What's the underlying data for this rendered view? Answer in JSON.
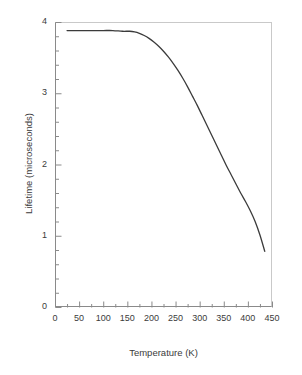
{
  "chart_data": {
    "type": "line",
    "title": "",
    "xlabel": "Temperature (K)",
    "ylabel": "Lifetime (microseconds)",
    "xlim": [
      0,
      450
    ],
    "ylim": [
      0,
      4
    ],
    "xticks": [
      0,
      50,
      100,
      150,
      200,
      250,
      300,
      350,
      400,
      450
    ],
    "yticks": [
      0,
      1,
      2,
      3,
      4
    ],
    "xtick_labels": [
      "0",
      "50",
      "100",
      "150",
      "200",
      "250",
      "300",
      "350",
      "400",
      "450"
    ],
    "ytick_labels": [
      "0",
      "1",
      "2",
      "3",
      "4"
    ],
    "x_minor_interval": 25,
    "y_minor_interval": 0.2,
    "grid": false,
    "legend": false,
    "line_color": "#3b3b3b",
    "line_width": 1.3,
    "series": [
      {
        "name": "Lifetime",
        "x": [
          25,
          40,
          60,
          80,
          100,
          120,
          140,
          155,
          165,
          175,
          185,
          195,
          205,
          215,
          225,
          235,
          245,
          255,
          265,
          275,
          285,
          295,
          305,
          315,
          325,
          335,
          345,
          355,
          365,
          375,
          385,
          395,
          405,
          415,
          425,
          435
        ],
        "y": [
          3.88,
          3.88,
          3.88,
          3.88,
          3.88,
          3.88,
          3.87,
          3.87,
          3.86,
          3.84,
          3.81,
          3.77,
          3.72,
          3.66,
          3.59,
          3.51,
          3.42,
          3.32,
          3.21,
          3.09,
          2.96,
          2.83,
          2.69,
          2.55,
          2.41,
          2.27,
          2.13,
          1.99,
          1.86,
          1.73,
          1.6,
          1.48,
          1.35,
          1.2,
          1.01,
          0.78
        ]
      }
    ]
  },
  "axes": {
    "frame_color": "#8a8a8a",
    "frame_color_light": "#c9c9c9",
    "background": "#ffffff"
  }
}
